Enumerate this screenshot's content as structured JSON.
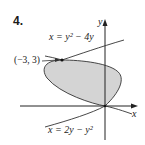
{
  "problem_number": "4.",
  "axes": {
    "x_label": "x",
    "y_label": "y"
  },
  "curves": [
    {
      "name": "upper-parabola",
      "equation": "x = y² − 4y"
    },
    {
      "name": "lower-parabola",
      "equation": "x = 2y − y²"
    }
  ],
  "intersection_points": [
    {
      "label": "(−3, 3)",
      "x": -3,
      "y": 3
    },
    {
      "label": "",
      "x": 0,
      "y": 0
    }
  ],
  "colors": {
    "region_fill": "#d4d4d4",
    "curve": "#333333",
    "axis": "#222222"
  }
}
